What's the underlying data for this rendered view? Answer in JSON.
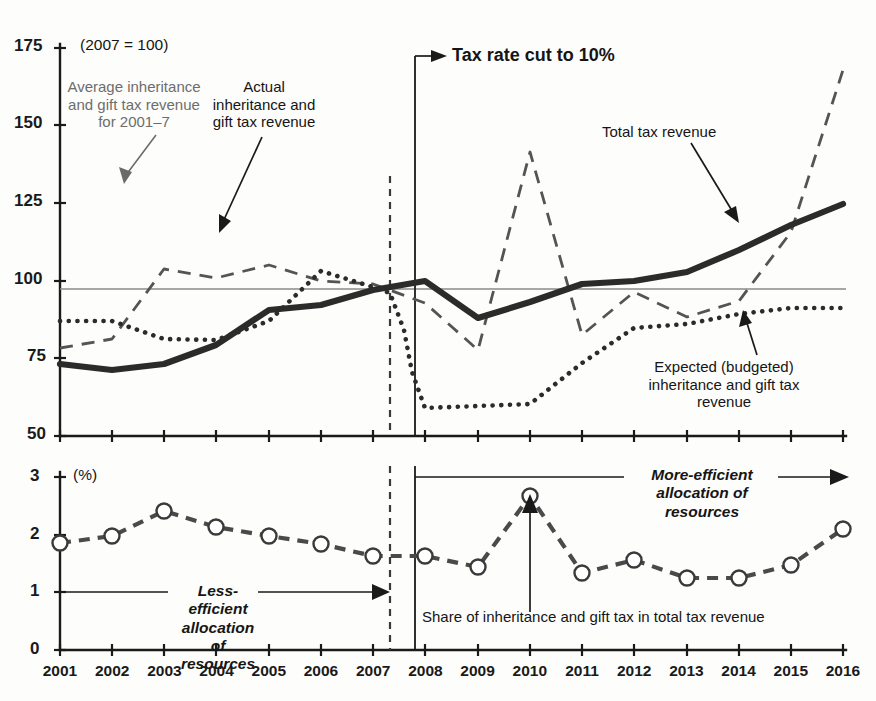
{
  "figure": {
    "index_note": "(2007 = 100)",
    "percent_note": "(%)"
  },
  "annotations": {
    "avg_line": "Average inheritance\nand gift tax revenue\nfor 2001–7",
    "avg_line_l1": "Average inheritance",
    "avg_line_l2": "and gift tax revenue",
    "avg_line_l3": "for 2001–7",
    "actual_l1": "Actual",
    "actual_l2": "inheritance and",
    "actual_l3": "gift tax revenue",
    "tax_rate_cut": "Tax rate cut to 10%",
    "total_tax_revenue": "Total tax revenue",
    "expected_l1": "Expected (budgeted)",
    "expected_l2": "inheritance and gift tax",
    "expected_l3": "revenue",
    "less_efficient_l1": "Less-efficient",
    "less_efficient_l2": "allocation of",
    "less_efficient_l3": "resources",
    "more_efficient_l1": "More-efficient",
    "more_efficient_l2": "allocation of",
    "more_efficient_l3": "resources",
    "share_caption": "Share of inheritance and gift tax in total tax revenue"
  },
  "colors": {
    "ink": "#1a1a1a",
    "total_line": "#2b2b2b",
    "actual_line": "#2b2b2b",
    "expected_line": "#545454",
    "share_line": "#4a4a4a",
    "average_ref": "#8a8a8a",
    "grey_text": "#6d6d6d",
    "background": "#fdfdfb"
  },
  "chart_data": [
    {
      "type": "line",
      "id": "index-panel",
      "title": "",
      "subtitle": "(2007 = 100)",
      "xlabel": "",
      "ylabel": "",
      "x": [
        2001,
        2002,
        2003,
        2004,
        2005,
        2006,
        2007,
        2008,
        2009,
        2010,
        2011,
        2012,
        2013,
        2014,
        2015,
        2016
      ],
      "xlim": [
        2001,
        2016
      ],
      "ylim": [
        50,
        175
      ],
      "yticks": [
        50,
        75,
        100,
        125,
        150,
        175
      ],
      "xticks": [
        2001,
        2002,
        2003,
        2004,
        2005,
        2006,
        2007,
        2008,
        2009,
        2010,
        2011,
        2012,
        2013,
        2014,
        2015,
        2016
      ],
      "grid": false,
      "legend": "annotations-on-plot",
      "series": [
        {
          "name": "Total tax revenue",
          "style": "solid-thick",
          "values": [
            73,
            71,
            73,
            78,
            84,
            91,
            92,
            95,
            101,
            101,
            88,
            92,
            96,
            101,
            105,
            106,
            116,
            127
          ]
        },
        {
          "name": "Actual inheritance and gift tax revenue",
          "style": "dotted",
          "values": [
            87,
            87,
            87,
            82,
            80,
            82,
            85,
            93,
            101,
            110,
            113,
            112,
            110,
            105,
            100,
            97,
            59,
            58,
            60,
            60,
            61,
            74,
            84,
            87,
            86,
            86,
            89,
            91,
            91,
            91
          ]
        },
        {
          "name": "Expected (budgeted) inheritance and gift tax revenue",
          "style": "dashed",
          "values": [
            80,
            82,
            85,
            104,
            102,
            101,
            103,
            105,
            101,
            98,
            99,
            93,
            78,
            141,
            82,
            90,
            96,
            89,
            88,
            93,
            115,
            167
          ]
        }
      ],
      "reference_lines": [
        {
          "name": "Average inheritance and gift tax revenue for 2001-7",
          "orientation": "horizontal",
          "value": 97.5,
          "style": "thin-solid"
        },
        {
          "name": "2007 boundary",
          "orientation": "vertical",
          "value": 2007,
          "style": "dashed"
        },
        {
          "name": "Tax rate cut to 10%",
          "orientation": "vertical",
          "value": 2007.5,
          "style": "solid"
        }
      ],
      "series_points": {
        "total_tax_revenue": {
          "2001": 73,
          "2002": 71,
          "2003": 73,
          "2004": 79,
          "2005": 90,
          "2006": 92,
          "2007": 97,
          "2008": 101,
          "2009": 88,
          "2010": 93,
          "2011": 99,
          "2012": 101,
          "2013": 104,
          "2014": 111,
          "2015": 119,
          "2016": 127
        },
        "actual_inheritance_and_gift_tax_revenue": {
          "2001": 87,
          "2002": 87,
          "2003": 81,
          "2004": 81,
          "2005": 87,
          "2006": 103,
          "2007": 98,
          "2008": 59,
          "2009": 60,
          "2010": 61,
          "2011": 74,
          "2012": 85,
          "2013": 86,
          "2014": 89,
          "2015": 91,
          "2016": 91
        },
        "expected_budgeted_inheritance_and_gift_tax_revenue": {
          "2001": 80,
          "2002": 83,
          "2003": 104,
          "2004": 101,
          "2005": 105,
          "2006": 100,
          "2007": 99,
          "2008": 93,
          "2009": 78,
          "2010": 141,
          "2011": 82,
          "2012": 96,
          "2013": 88,
          "2014": 93,
          "2015": 115,
          "2016": 167
        }
      }
    },
    {
      "type": "line",
      "id": "share-panel",
      "title": "Share of inheritance and gift tax in total tax revenue",
      "subtitle": "(%)",
      "xlabel": "",
      "ylabel": "",
      "x": [
        2001,
        2002,
        2003,
        2004,
        2005,
        2006,
        2007,
        2008,
        2009,
        2010,
        2011,
        2012,
        2013,
        2014,
        2015,
        2016
      ],
      "xlim": [
        2001,
        2016
      ],
      "ylim": [
        0,
        3
      ],
      "yticks": [
        0,
        1,
        2,
        3
      ],
      "grid": false,
      "markers": "open-circle",
      "series": [
        {
          "name": "Share of inheritance and gift tax in total tax revenue",
          "style": "dashed-with-markers",
          "values": [
            1.84,
            1.96,
            2.39,
            2.11,
            1.96,
            1.81,
            1.62,
            1.62,
            1.43,
            2.42,
            1.33,
            1.55,
            1.25,
            1.24,
            1.47,
            2.09
          ]
        }
      ],
      "reference_lines": [
        {
          "name": "2007 boundary",
          "orientation": "vertical",
          "value": 2007,
          "style": "dashed"
        },
        {
          "name": "Tax rate cut to 10%",
          "orientation": "vertical",
          "value": 2007.5,
          "style": "solid"
        }
      ]
    }
  ],
  "axes": {
    "top_yticks": [
      "175",
      "150",
      "125",
      "100",
      "75",
      "50"
    ],
    "bottom_yticks": [
      "3",
      "2",
      "1",
      "0"
    ],
    "xticks": [
      "2001",
      "2002",
      "2003",
      "2004",
      "2005",
      "2006",
      "2007",
      "2008",
      "2009",
      "2010",
      "2011",
      "2012",
      "2013",
      "2014",
      "2015",
      "2016"
    ]
  }
}
